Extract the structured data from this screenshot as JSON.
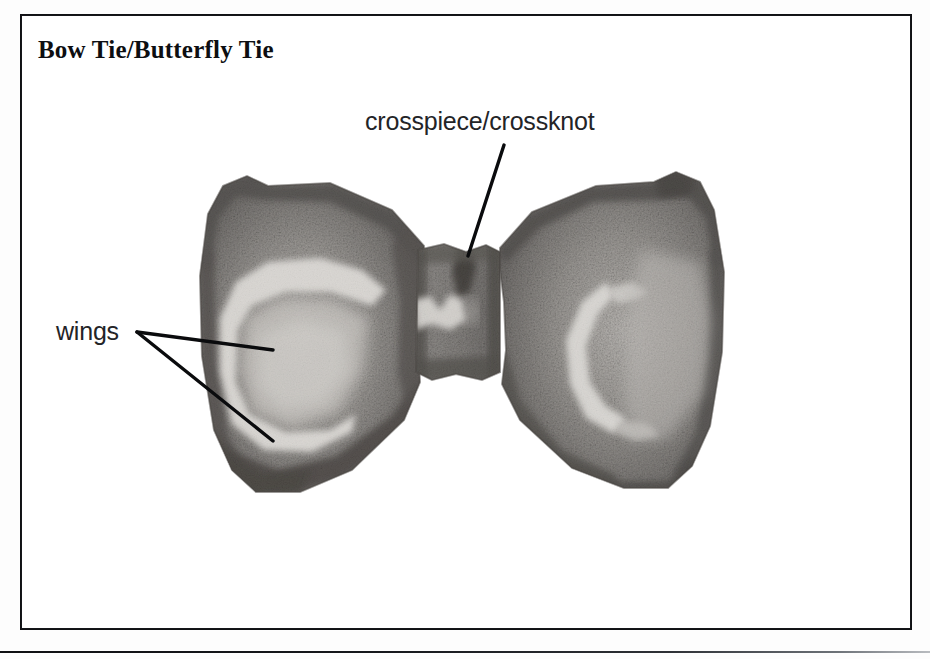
{
  "page": {
    "width": 930,
    "height": 659,
    "background_color": "#ffffff"
  },
  "figure": {
    "title": "Bow Tie/Butterfly Tie",
    "caption_style": "bold serif heading inside ruled box",
    "medium": "pencil / charcoal grain illustration",
    "frame": {
      "stroke_color": "#15161a",
      "stroke_width_px": 2.5,
      "x": 20,
      "y": 14,
      "width": 892,
      "height": 616
    },
    "baseline_rule": {
      "stroke_color": "#101114",
      "y": 651,
      "width": 930
    }
  },
  "labels": [
    {
      "id": "crosspiece",
      "text": "crosspiece/crossknot",
      "x": 365,
      "y": 107,
      "font_size_px": 25,
      "color": "#232427",
      "leader": {
        "from_x": 504,
        "from_y": 145,
        "to_x": 468,
        "to_y": 256,
        "stroke_width_px": 3.4,
        "color": "#0a0b0d"
      }
    },
    {
      "id": "wings",
      "text": "wings",
      "x": 56,
      "y": 317,
      "font_size_px": 25,
      "color": "#232427",
      "leaders": [
        {
          "from_x": 137,
          "from_y": 332,
          "to_x": 273,
          "to_y": 350,
          "stroke_width_px": 3.4,
          "color": "#0a0b0d"
        },
        {
          "from_x": 137,
          "from_y": 332,
          "to_x": 273,
          "to_y": 441,
          "stroke_width_px": 3.4,
          "color": "#0a0b0d"
        }
      ]
    }
  ],
  "illustration": {
    "subject": "bow tie / butterfly tie, front view, symmetric, tied",
    "bounds": {
      "x": 196,
      "y": 168,
      "width": 530,
      "height": 325
    },
    "parts": [
      {
        "name": "left-wing",
        "description": "fan-shaped left wing, dark graphite edge, pale highlight crescent in centre",
        "bounds": {
          "x": 196,
          "y": 170,
          "width": 232,
          "height": 322
        }
      },
      {
        "name": "crossknot",
        "description": "narrow vertical knot band joining the two wings, notched top centre",
        "bounds": {
          "x": 414,
          "y": 243,
          "width": 88,
          "height": 140
        }
      },
      {
        "name": "right-wing",
        "description": "fan-shaped right wing, dark graphite edge, pale highlight crescent in centre",
        "bounds": {
          "x": 498,
          "y": 168,
          "width": 228,
          "height": 320
        }
      }
    ],
    "tones": {
      "paper": "#ffffff",
      "light_graphite": "#b9b6b2",
      "mid_graphite": "#8d8a87",
      "dark_graphite": "#5d5a58",
      "deep_edge": "#43403e",
      "highlight": "#f2f0ec"
    }
  }
}
